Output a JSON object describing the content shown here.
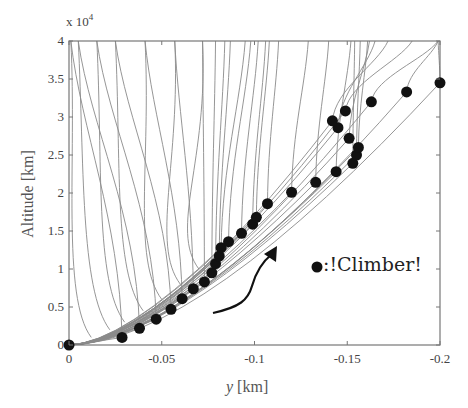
{
  "chart_data": {
    "type": "line",
    "title": "",
    "xlabel": "y [km]",
    "xlabel_italic_part": "y",
    "xlabel_unit": "[km]",
    "ylabel": "Altitude [km]",
    "y_exponent_label": "x 10",
    "y_exponent_power": "4",
    "xlim": [
      0,
      -0.2
    ],
    "ylim": [
      0,
      4
    ],
    "y_multiplier": 10000,
    "grid": false,
    "x_ticks": [
      0,
      -0.05,
      -0.1,
      -0.15,
      -0.2
    ],
    "x_tick_labels": [
      "0",
      "-0.05",
      "-0.1",
      "-0.15",
      "-0.2"
    ],
    "y_ticks": [
      0,
      0.5,
      1,
      1.5,
      2,
      2.5,
      3,
      3.5,
      4
    ],
    "y_tick_labels": [
      "0",
      "0.5",
      "1",
      "1.5",
      "2",
      "2.5",
      "3",
      "3.5",
      "4"
    ],
    "legend": {
      "position": "inside-right",
      "entries": [
        {
          "marker": "filled-circle",
          "label": ":!Climber!"
        }
      ]
    },
    "annotations": [
      {
        "type": "curved-arrow",
        "direction": "up-right",
        "meaning": "climber ascent direction"
      }
    ],
    "series": [
      {
        "name": "Climber",
        "style": "markers",
        "x": [
          0,
          -0.0286,
          -0.038,
          -0.047,
          -0.055,
          -0.061,
          -0.067,
          -0.073,
          -0.077,
          -0.079,
          -0.081,
          -0.082,
          -0.086,
          -0.093,
          -0.099,
          -0.101,
          -0.107,
          -0.12,
          -0.133,
          -0.144,
          -0.153,
          -0.155,
          -0.156,
          -0.151,
          -0.145,
          -0.142,
          -0.149,
          -0.163,
          -0.182,
          -0.2
        ],
        "y": [
          0,
          0.1,
          0.22,
          0.34,
          0.47,
          0.61,
          0.74,
          0.83,
          0.95,
          1.07,
          1.17,
          1.28,
          1.36,
          1.47,
          1.59,
          1.68,
          1.86,
          2.01,
          2.14,
          2.28,
          2.39,
          2.5,
          2.6,
          2.72,
          2.86,
          2.95,
          3.08,
          3.2,
          3.33,
          3.45
        ]
      },
      {
        "name": "Ribbon curves",
        "style": "thin-gray-lines",
        "description": "Family of ribbon shape profiles; each starts at origin, rises diagonally to a climber position then runs near-vertically to the top (4 x10^4). Earlier profiles swing back toward -0.01..-0.09 at the top.",
        "top_x": [
          -0.001,
          -0.005,
          -0.015,
          -0.025,
          -0.041,
          -0.057,
          -0.072,
          -0.079,
          -0.084,
          -0.087,
          -0.095,
          -0.098,
          -0.102,
          -0.106,
          -0.108,
          -0.113,
          -0.129,
          -0.14,
          -0.152,
          -0.154,
          -0.157,
          -0.161,
          -0.162,
          -0.165,
          -0.172,
          -0.185,
          -0.199
        ]
      }
    ]
  }
}
